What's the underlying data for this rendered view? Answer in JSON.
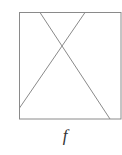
{
  "figure": {
    "label": "f",
    "stroke_color": "#8a8a8a",
    "square": {
      "x1": 19,
      "y1": 12,
      "x2": 121,
      "y2": 119
    },
    "lines": [
      {
        "name": "diagonal-1",
        "x1": 40,
        "y1": 12,
        "x2": 110,
        "y2": 119
      },
      {
        "name": "diagonal-2",
        "x1": 85,
        "y1": 12,
        "x2": 19,
        "y2": 108
      }
    ]
  }
}
